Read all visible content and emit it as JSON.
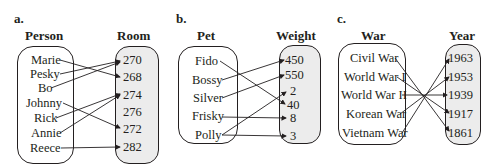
{
  "panels": [
    {
      "letter": "a.",
      "domain_title": "Person",
      "range_title": "Room",
      "domain": [
        "Marie",
        "Pesky",
        "Bo",
        "Johnny",
        "Rick",
        "Annie",
        "Reece"
      ],
      "range": [
        "270",
        "268",
        "274",
        "276",
        "272",
        "282"
      ],
      "mapping": [
        {
          "from": "Marie",
          "to": "268"
        },
        {
          "from": "Pesky",
          "to": "270"
        },
        {
          "from": "Bo",
          "to": "270"
        },
        {
          "from": "Johnny",
          "to": "272"
        },
        {
          "from": "Rick",
          "to": "274"
        },
        {
          "from": "Annie",
          "to": "274"
        },
        {
          "from": "Reece",
          "to": "282"
        }
      ]
    },
    {
      "letter": "b.",
      "domain_title": "Pet",
      "range_title": "Weight",
      "domain": [
        "Fido",
        "Bossy",
        "Silver",
        "Frisky",
        "Polly"
      ],
      "range": [
        "450",
        "550",
        "2",
        "40",
        "8",
        "3"
      ],
      "mapping": [
        {
          "from": "Fido",
          "to": "40"
        },
        {
          "from": "Bossy",
          "to": "450"
        },
        {
          "from": "Silver",
          "to": "550"
        },
        {
          "from": "Frisky",
          "to": "8"
        },
        {
          "from": "Polly",
          "to": "2"
        },
        {
          "from": "Polly",
          "to": "3"
        }
      ]
    },
    {
      "letter": "c.",
      "domain_title": "War",
      "range_title": "Year",
      "domain": [
        "Civil War",
        "World War I",
        "World War II",
        "Korean War",
        "Vietnam War"
      ],
      "range": [
        "1963",
        "1953",
        "1939",
        "1917",
        "1861"
      ],
      "mapping": [
        {
          "from": "Civil War",
          "to": "1861"
        },
        {
          "from": "World War I",
          "to": "1917"
        },
        {
          "from": "World War II",
          "to": "1939"
        },
        {
          "from": "Korean War",
          "to": "1953"
        },
        {
          "from": "Vietnam War",
          "to": "1963"
        }
      ]
    }
  ],
  "colors": {
    "line": "#231f20",
    "range_fill": "#ececec",
    "domain_fill": "#ffffff"
  }
}
